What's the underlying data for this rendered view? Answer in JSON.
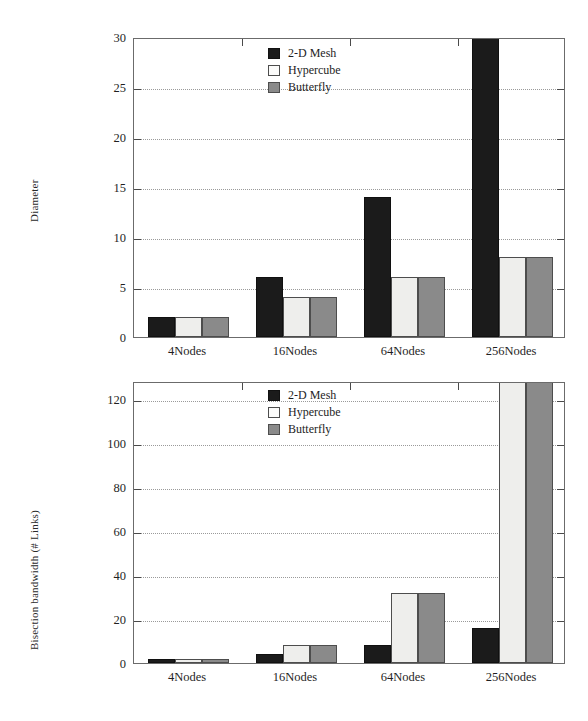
{
  "chart_data": [
    {
      "type": "bar",
      "title": "",
      "xlabel": "",
      "ylabel": "Diameter",
      "categories": [
        "4Nodes",
        "16Nodes",
        "64Nodes",
        "256Nodes"
      ],
      "ylim": [
        0,
        30
      ],
      "yticks": [
        0,
        5,
        10,
        15,
        20,
        25,
        30
      ],
      "grid": true,
      "legend_position": "top-right",
      "series": [
        {
          "name": "2-D Mesh",
          "color": "#1b1b1b",
          "values": [
            2,
            6,
            14,
            30
          ]
        },
        {
          "name": "Hypercube",
          "color": "#eeeeec",
          "values": [
            2,
            4,
            6,
            8
          ]
        },
        {
          "name": "Butterfly",
          "color": "#8a8a8a",
          "values": [
            2,
            4,
            6,
            8
          ]
        }
      ]
    },
    {
      "type": "bar",
      "title": "",
      "xlabel": "",
      "ylabel": "Bisection bandwidth (# Links)",
      "categories": [
        "4Nodes",
        "16Nodes",
        "64Nodes",
        "256Nodes"
      ],
      "ylim": [
        0,
        128
      ],
      "yticks": [
        0,
        20,
        40,
        60,
        80,
        100,
        120
      ],
      "grid": true,
      "legend_position": "top-right",
      "series": [
        {
          "name": "2-D Mesh",
          "color": "#1b1b1b",
          "values": [
            2,
            4,
            8,
            16
          ]
        },
        {
          "name": "Hypercube",
          "color": "#eeeeec",
          "values": [
            2,
            8,
            32,
            128
          ]
        },
        {
          "name": "Butterfly",
          "color": "#8a8a8a",
          "values": [
            2,
            8,
            32,
            128
          ]
        }
      ]
    }
  ],
  "top_chart": {
    "ylabel": "Diameter",
    "ytick_labels": [
      "0",
      "5",
      "10",
      "15",
      "20",
      "25",
      "30"
    ],
    "xtick_labels": [
      "4Nodes",
      "16Nodes",
      "64Nodes",
      "256Nodes"
    ],
    "legend": [
      {
        "label": "2-D Mesh"
      },
      {
        "label": "Hypercube"
      },
      {
        "label": "Butterfly"
      }
    ]
  },
  "bottom_chart": {
    "ylabel": "Bisection bandwidth (# Links)",
    "ytick_labels": [
      "0",
      "20",
      "40",
      "60",
      "80",
      "100",
      "120"
    ],
    "xtick_labels": [
      "4Nodes",
      "16Nodes",
      "64Nodes",
      "256Nodes"
    ],
    "legend": [
      {
        "label": "2-D Mesh"
      },
      {
        "label": "Hypercube"
      },
      {
        "label": "Butterfly"
      }
    ]
  }
}
